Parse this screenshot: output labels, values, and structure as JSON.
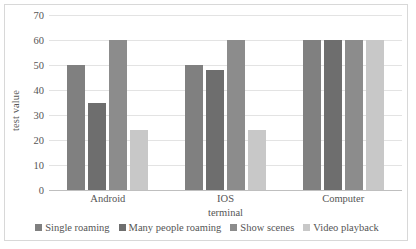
{
  "chart_data": {
    "type": "bar",
    "title": "",
    "xlabel": "terminal",
    "ylabel": "test value",
    "categories": [
      "Android",
      "IOS",
      "Computer"
    ],
    "series": [
      {
        "name": "Single roaming",
        "color": "#808080",
        "values": [
          50,
          50,
          60
        ]
      },
      {
        "name": "Many people roaming",
        "color": "#6e6e6e",
        "values": [
          35,
          48,
          60
        ]
      },
      {
        "name": "Show scenes",
        "color": "#8c8c8c",
        "values": [
          60,
          60,
          60
        ]
      },
      {
        "name": "Video playback",
        "color": "#c8c8c8",
        "values": [
          24,
          24,
          60
        ]
      }
    ],
    "ylim": [
      0,
      70
    ],
    "ytick_step": 10,
    "yticks": [
      70,
      60,
      50,
      40,
      30,
      20,
      10,
      0
    ],
    "grid": true,
    "legend_position": "bottom"
  },
  "axes": {
    "y_title": "test value",
    "x_title": "terminal"
  }
}
